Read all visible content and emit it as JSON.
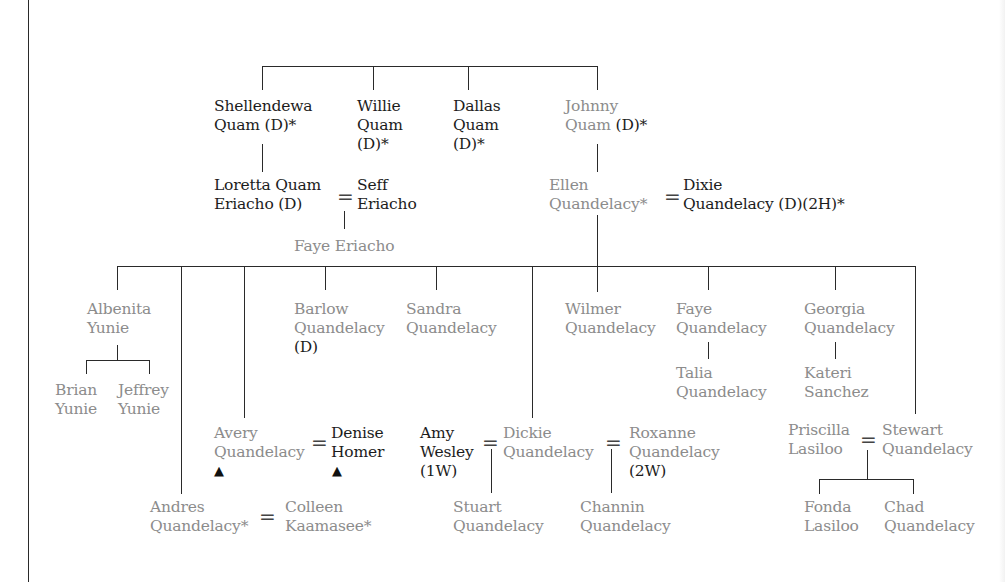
{
  "diagram": {
    "type": "family-tree",
    "legend_markers": {
      "deceased": "(D)",
      "asterisk": "*",
      "first_wife": "(1W)",
      "second_wife": "(2W)",
      "second_husband": "(2H)",
      "marker": "▲"
    },
    "colors": {
      "primary_text": "#1c1c1c",
      "secondary_text": "#8c8c8c",
      "lines": "#2a2a2a"
    },
    "generation1": {
      "shellendewa": {
        "l1": "Shellendewa",
        "l2": "Quam (D)*"
      },
      "willie": {
        "l1": "Willie",
        "l2": "Quam",
        "l3": "(D)*"
      },
      "dallas": {
        "l1": "Dallas",
        "l2": "Quam",
        "l3": "(D)*"
      },
      "johnny": {
        "l1": "Johnny",
        "l2a": "Quam ",
        "l2b": "(D)*"
      }
    },
    "generation2": {
      "loretta": {
        "l1": "Loretta Quam",
        "l2": "Eriacho (D)"
      },
      "seff": {
        "l1": "Seff",
        "l2": "Eriacho"
      },
      "faye_eriacho": {
        "l1": "Faye Eriacho"
      },
      "ellen": {
        "l1": "Ellen",
        "l2": "Quandelacy*"
      },
      "dixie": {
        "l1": "Dixie",
        "l2": "Quandelacy (D)(2H)*"
      },
      "equals": "="
    },
    "generation3": {
      "albenita": {
        "l1": "Albenita",
        "l2": "Yunie"
      },
      "brian": {
        "l1": "Brian",
        "l2": "Yunie"
      },
      "jeffrey": {
        "l1": "Jeffrey",
        "l2": "Yunie"
      },
      "andres": {
        "l1": "Andres",
        "l2": "Quandelacy*"
      },
      "colleen": {
        "l1": "Colleen",
        "l2": "Kaamasee*"
      },
      "avery": {
        "l1": "Avery",
        "l2": "Quandelacy",
        "marker": "▲"
      },
      "denise": {
        "l1": "Denise",
        "l2": "Homer",
        "marker": "▲"
      },
      "barlow": {
        "l1": "Barlow",
        "l2": "Quandelacy",
        "l3": "(D)"
      },
      "sandra": {
        "l1": "Sandra",
        "l2": "Quandelacy"
      },
      "amy": {
        "l1": "Amy",
        "l2": "Wesley",
        "l3": "(1W)"
      },
      "dickie": {
        "l1": "Dickie",
        "l2": "Quandelacy"
      },
      "roxanne": {
        "l1": "Roxanne",
        "l2": "Quandelacy",
        "l3": "(2W)"
      },
      "stuart": {
        "l1": "Stuart",
        "l2": "Quandelacy"
      },
      "channin": {
        "l1": "Channin",
        "l2": "Quandelacy"
      },
      "wilmer": {
        "l1": "Wilmer",
        "l2": "Quandelacy"
      },
      "faye_q": {
        "l1": "Faye",
        "l2": "Quandelacy"
      },
      "talia": {
        "l1": "Talia",
        "l2": "Quandelacy"
      },
      "georgia": {
        "l1": "Georgia",
        "l2": "Quandelacy"
      },
      "kateri": {
        "l1": "Kateri",
        "l2": "Sanchez"
      },
      "priscilla": {
        "l1": "Priscilla",
        "l2": "Lasiloo"
      },
      "stewart": {
        "l1": "Stewart",
        "l2": "Quandelacy"
      },
      "fonda": {
        "l1": "Fonda",
        "l2": "Lasiloo"
      },
      "chad": {
        "l1": "Chad",
        "l2": "Quandelacy"
      }
    }
  }
}
